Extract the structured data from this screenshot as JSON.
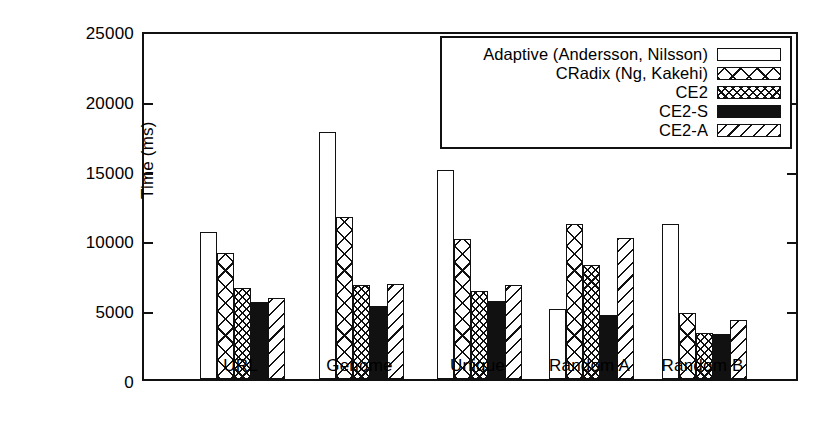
{
  "chart_data": {
    "type": "bar",
    "title": "",
    "xlabel": "",
    "ylabel": "Time (ms)",
    "ylim": [
      0,
      25000
    ],
    "yticks": [
      0,
      5000,
      10000,
      15000,
      20000,
      25000
    ],
    "ytick_labels": [
      "0",
      "5000",
      "10000",
      "15000",
      "20000",
      "25000"
    ],
    "grid": false,
    "legend_position": "upper right",
    "categories": [
      "URL",
      "Genome",
      "Unique",
      "Random A",
      "Random B"
    ],
    "series": [
      {
        "name": "Adaptive (Andersson, Nilsson)",
        "pattern": "plain",
        "values": [
          10500,
          17700,
          15000,
          5000,
          11100
        ]
      },
      {
        "name": "CRadix (Ng, Kakehi)",
        "pattern": "cross-hatch-large",
        "values": [
          9000,
          11600,
          10000,
          11100,
          4700
        ]
      },
      {
        "name": "CE2",
        "pattern": "cross-hatch-fine",
        "values": [
          6500,
          6700,
          6300,
          8200,
          3300
        ]
      },
      {
        "name": "CE2-S",
        "pattern": "solid",
        "values": [
          5500,
          5200,
          5600,
          4600,
          3200
        ]
      },
      {
        "name": "CE2-A",
        "pattern": "diagonal",
        "values": [
          5800,
          6800,
          6700,
          10100,
          4200
        ]
      }
    ]
  },
  "axis": {
    "y_label": "Time (ms)",
    "y_ticks": [
      "25000",
      "20000",
      "15000",
      "10000",
      "5000",
      "0"
    ],
    "x_ticks": [
      "URL",
      "Genome",
      "Unique",
      "Random A",
      "Random B"
    ]
  },
  "legend": {
    "items": [
      {
        "label": "Adaptive (Andersson, Nilsson)",
        "swatch": "plain-swatch"
      },
      {
        "label": "CRadix (Ng, Kakehi)",
        "swatch": "cross-hatch-large-swatch"
      },
      {
        "label": "CE2",
        "swatch": "cross-hatch-fine-swatch"
      },
      {
        "label": "CE2-S",
        "swatch": "solid-swatch"
      },
      {
        "label": "CE2-A",
        "swatch": "diagonal-swatch"
      }
    ]
  },
  "colors": {
    "foreground": "#111111",
    "background": "#ffffff"
  }
}
